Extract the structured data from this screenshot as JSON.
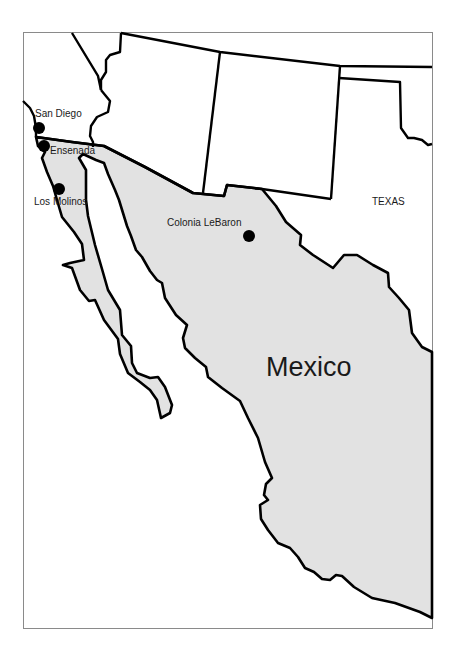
{
  "map": {
    "colors": {
      "background": "#ffffff",
      "mexico_fill": "#e2e2e2",
      "border_stroke": "#000000",
      "frame_stroke": "#8a8a8a",
      "city_dot": "#000000",
      "label_text": "#1a1a1a"
    },
    "country_label": "Mexico",
    "region_labels": [
      {
        "name": "TEXAS"
      }
    ],
    "cities": [
      {
        "name": "San Diego",
        "marker": "filled-circle"
      },
      {
        "name": "Ensenada",
        "marker": "filled-circle"
      },
      {
        "name": "Los Molinos",
        "marker": "filled-circle"
      },
      {
        "name": "Colonia LeBaron",
        "marker": "filled-circle"
      }
    ]
  }
}
